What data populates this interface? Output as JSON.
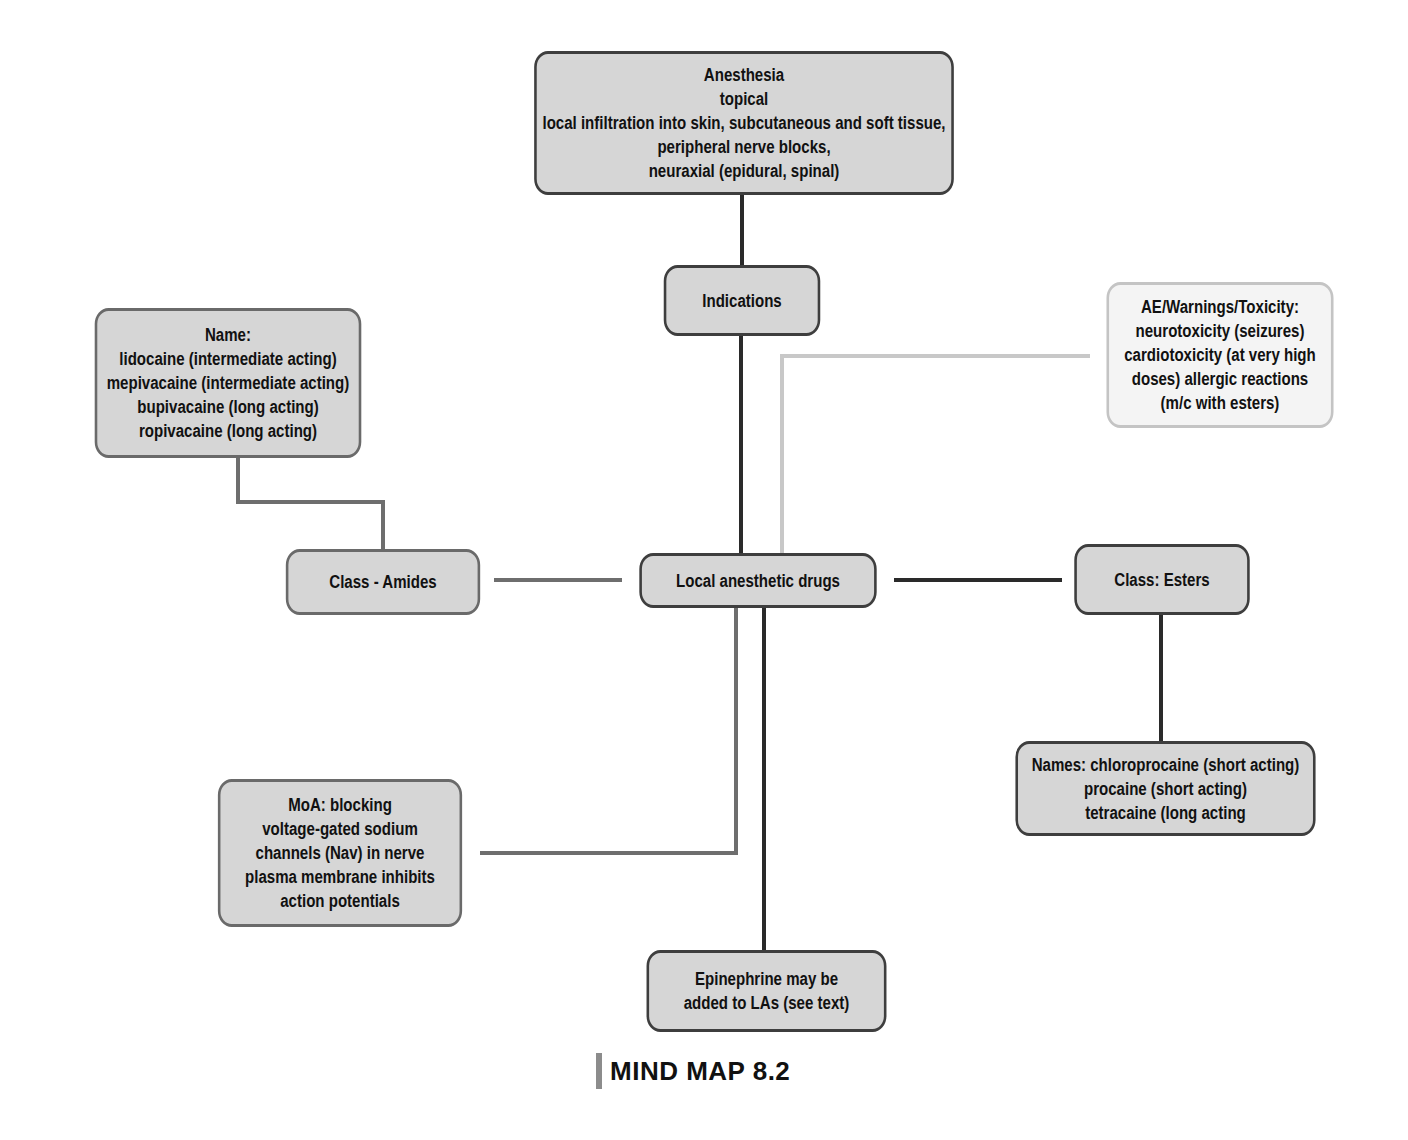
{
  "diagram": {
    "type": "mind-map",
    "central_node": "Local anesthetic drugs",
    "caption": "MIND MAP 8.2",
    "colors": {
      "node_fill": "#d6d6d6",
      "node_border": "#3e3e3e",
      "light_node_fill": "#f4f4f4",
      "light_node_border": "#c4c4c4",
      "connector_dark": "#2a2a2a",
      "connector_mid": "#6e6e6e",
      "connector_light": "#c8c8c8",
      "caption_bar": "#8c8c8c"
    },
    "nodes": {
      "anesthesia": {
        "lines": [
          "Anesthesia",
          "topical",
          "local infiltration into skin, subcutaneous and soft tissue,",
          "peripheral nerve blocks,",
          "neuraxial (epidural, spinal)"
        ]
      },
      "indications": {
        "label": "Indications"
      },
      "ae_warnings": {
        "lines": [
          "AE/Warnings/Toxicity:",
          "neurotoxicity (seizures)",
          "cardiotoxicity (at very high",
          "doses) allergic reactions",
          "(m/c with esters)"
        ]
      },
      "amide_names": {
        "lines": [
          "Name:",
          "lidocaine (intermediate acting)",
          "mepivacaine (intermediate acting)",
          "bupivacaine (long acting)",
          "ropivacaine (long acting)"
        ]
      },
      "class_amides": {
        "label": "Class - Amides"
      },
      "central": {
        "label": "Local anesthetic drugs"
      },
      "class_esters": {
        "label": "Class: Esters"
      },
      "ester_names": {
        "lines": [
          "Names: chloroprocaine (short acting)",
          "procaine (short acting)",
          "tetracaine (long acting"
        ]
      },
      "moa": {
        "lines": [
          "MoA: blocking",
          "voltage-gated sodium",
          "channels (Nav) in nerve",
          "plasma membrane inhibits",
          "action potentials"
        ]
      },
      "epinephrine": {
        "lines": [
          "Epinephrine may be",
          "added to LAs (see text)"
        ]
      }
    },
    "edges": [
      {
        "from": "central",
        "to": "indications",
        "color": "dark"
      },
      {
        "from": "indications",
        "to": "anesthesia",
        "color": "dark"
      },
      {
        "from": "central",
        "to": "ae_warnings",
        "color": "light"
      },
      {
        "from": "central",
        "to": "class_amides",
        "color": "mid"
      },
      {
        "from": "class_amides",
        "to": "amide_names",
        "color": "mid"
      },
      {
        "from": "central",
        "to": "class_esters",
        "color": "dark"
      },
      {
        "from": "class_esters",
        "to": "ester_names",
        "color": "dark"
      },
      {
        "from": "central",
        "to": "moa",
        "color": "mid"
      },
      {
        "from": "central",
        "to": "epinephrine",
        "color": "dark"
      }
    ]
  }
}
